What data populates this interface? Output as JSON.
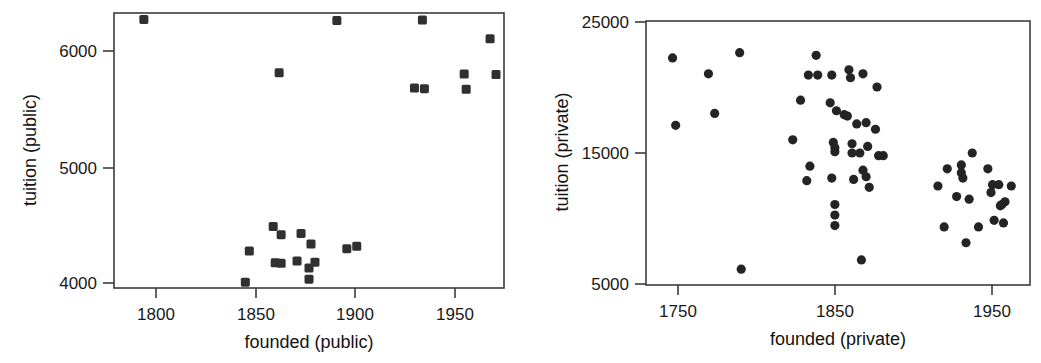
{
  "figure": {
    "background_color": "#ffffff",
    "marker_color": "#303030",
    "axis_color": "#3c3c3c",
    "panel_count": 2
  },
  "panels": [
    {
      "id": "public",
      "xlabel": "founded (public)",
      "ylabel": "tuition (public)",
      "xticks": [
        "1800",
        "1850",
        "1900",
        "1950"
      ],
      "yticks": [
        "6000",
        "5000",
        "4000"
      ]
    },
    {
      "id": "private",
      "xlabel": "founded (private)",
      "ylabel": "tuition (private)",
      "xticks": [
        "1750",
        "1850",
        "1950"
      ],
      "yticks": [
        "25000",
        "15000",
        "5000"
      ]
    }
  ],
  "chart_data": [
    {
      "type": "scatter",
      "title": "",
      "xlabel": "founded (public)",
      "ylabel": "tuition (public)",
      "xlim": [
        1772,
        1968
      ],
      "ylim": [
        3955,
        6300
      ],
      "xticks": [
        1800,
        1850,
        1900,
        1950
      ],
      "yticks": [
        4000,
        5000,
        6000
      ],
      "grid": false,
      "legend": "none",
      "marker": "square",
      "points": [
        {
          "x": 1787,
          "y": 6245
        },
        {
          "x": 1884,
          "y": 6235
        },
        {
          "x": 1927,
          "y": 6240
        },
        {
          "x": 1961,
          "y": 6080
        },
        {
          "x": 1855,
          "y": 5790
        },
        {
          "x": 1948,
          "y": 5780
        },
        {
          "x": 1964,
          "y": 5775
        },
        {
          "x": 1923,
          "y": 5660
        },
        {
          "x": 1928,
          "y": 5655
        },
        {
          "x": 1949,
          "y": 5650
        },
        {
          "x": 1852,
          "y": 4480
        },
        {
          "x": 1856,
          "y": 4410
        },
        {
          "x": 1866,
          "y": 4420
        },
        {
          "x": 1871,
          "y": 4330
        },
        {
          "x": 1840,
          "y": 4270
        },
        {
          "x": 1889,
          "y": 4290
        },
        {
          "x": 1894,
          "y": 4310
        },
        {
          "x": 1853,
          "y": 4170
        },
        {
          "x": 1856,
          "y": 4165
        },
        {
          "x": 1864,
          "y": 4185
        },
        {
          "x": 1873,
          "y": 4175
        },
        {
          "x": 1870,
          "y": 4125
        },
        {
          "x": 1870,
          "y": 4030
        },
        {
          "x": 1838,
          "y": 4005
        }
      ]
    },
    {
      "type": "scatter",
      "title": "",
      "xlabel": "founded (private)",
      "ylabel": "tuition (private)",
      "xlim": [
        1729,
        1975
      ],
      "ylim": [
        5000,
        25000
      ],
      "xticks": [
        1750,
        1850,
        1950
      ],
      "yticks": [
        5000,
        15000,
        25000
      ],
      "grid": false,
      "legend": "none",
      "marker": "circle",
      "points": [
        {
          "x": 1746,
          "y": 22200
        },
        {
          "x": 1769,
          "y": 21000
        },
        {
          "x": 1789,
          "y": 22600
        },
        {
          "x": 1838,
          "y": 22400
        },
        {
          "x": 1833,
          "y": 20900
        },
        {
          "x": 1839,
          "y": 20900
        },
        {
          "x": 1848,
          "y": 20900
        },
        {
          "x": 1859,
          "y": 21300
        },
        {
          "x": 1860,
          "y": 20700
        },
        {
          "x": 1868,
          "y": 21000
        },
        {
          "x": 1877,
          "y": 20000
        },
        {
          "x": 1748,
          "y": 17100
        },
        {
          "x": 1773,
          "y": 18000
        },
        {
          "x": 1828,
          "y": 19000
        },
        {
          "x": 1847,
          "y": 18800
        },
        {
          "x": 1851,
          "y": 18200
        },
        {
          "x": 1856,
          "y": 17900
        },
        {
          "x": 1858,
          "y": 17800
        },
        {
          "x": 1864,
          "y": 17200
        },
        {
          "x": 1870,
          "y": 17300
        },
        {
          "x": 1876,
          "y": 16800
        },
        {
          "x": 1823,
          "y": 16000
        },
        {
          "x": 1849,
          "y": 15800
        },
        {
          "x": 1850,
          "y": 15400
        },
        {
          "x": 1850,
          "y": 15100
        },
        {
          "x": 1861,
          "y": 15700
        },
        {
          "x": 1861,
          "y": 15000
        },
        {
          "x": 1866,
          "y": 15000
        },
        {
          "x": 1871,
          "y": 15500
        },
        {
          "x": 1878,
          "y": 14800
        },
        {
          "x": 1881,
          "y": 14800
        },
        {
          "x": 1834,
          "y": 14000
        },
        {
          "x": 1832,
          "y": 12900
        },
        {
          "x": 1848,
          "y": 13100
        },
        {
          "x": 1862,
          "y": 13000
        },
        {
          "x": 1868,
          "y": 13700
        },
        {
          "x": 1870,
          "y": 13200
        },
        {
          "x": 1872,
          "y": 12400
        },
        {
          "x": 1916,
          "y": 12500
        },
        {
          "x": 1922,
          "y": 13800
        },
        {
          "x": 1931,
          "y": 14100
        },
        {
          "x": 1931,
          "y": 13500
        },
        {
          "x": 1932,
          "y": 13100
        },
        {
          "x": 1938,
          "y": 15000
        },
        {
          "x": 1928,
          "y": 11700
        },
        {
          "x": 1936,
          "y": 11500
        },
        {
          "x": 1948,
          "y": 13800
        },
        {
          "x": 1951,
          "y": 12600
        },
        {
          "x": 1955,
          "y": 12600
        },
        {
          "x": 1963,
          "y": 12500
        },
        {
          "x": 1950,
          "y": 12000
        },
        {
          "x": 1956,
          "y": 11000
        },
        {
          "x": 1957,
          "y": 11100
        },
        {
          "x": 1959,
          "y": 11300
        },
        {
          "x": 1952,
          "y": 9900
        },
        {
          "x": 1958,
          "y": 9700
        },
        {
          "x": 1850,
          "y": 11100
        },
        {
          "x": 1850,
          "y": 10300
        },
        {
          "x": 1850,
          "y": 9500
        },
        {
          "x": 1920,
          "y": 9400
        },
        {
          "x": 1942,
          "y": 9400
        },
        {
          "x": 1934,
          "y": 8200
        },
        {
          "x": 1867,
          "y": 6900
        },
        {
          "x": 1790,
          "y": 6200
        }
      ]
    }
  ]
}
